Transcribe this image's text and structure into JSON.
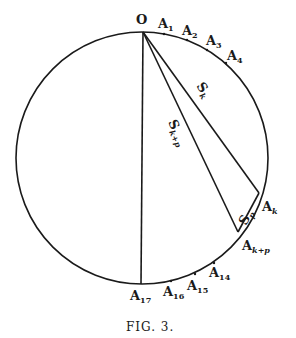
{
  "figure": {
    "caption": "FIG. 3.",
    "circle": {
      "cx": 142,
      "cy": 158,
      "r": 126
    },
    "points": {
      "O": {
        "label": "O",
        "sub": ""
      },
      "A1": {
        "label": "A",
        "sub": "1"
      },
      "A2": {
        "label": "A",
        "sub": "2"
      },
      "A3": {
        "label": "A",
        "sub": "3"
      },
      "A4": {
        "label": "A",
        "sub": "4"
      },
      "Ak": {
        "label": "A",
        "sub": "k"
      },
      "Akp": {
        "label": "A",
        "sub": "k+p"
      },
      "A14": {
        "label": "A",
        "sub": "14"
      },
      "A15": {
        "label": "A",
        "sub": "15"
      },
      "A16": {
        "label": "A",
        "sub": "16"
      },
      "A17": {
        "label": "A",
        "sub": "17"
      }
    },
    "segments": {
      "Sk": {
        "label": "S",
        "sub": "k"
      },
      "Skp": {
        "label": "S",
        "sub": "k+p"
      },
      "Sp": {
        "label": "S",
        "sub": "p"
      }
    }
  }
}
